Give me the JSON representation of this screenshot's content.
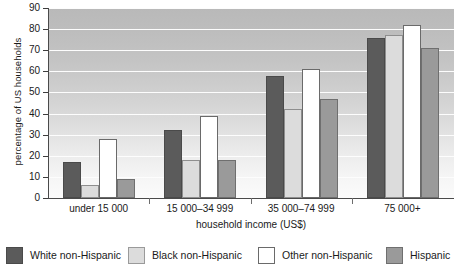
{
  "chart_data": {
    "type": "bar",
    "title": "",
    "xlabel": "household income (US$)",
    "ylabel": "percentage of US households",
    "categories": [
      "under 15 000",
      "15 000–34 999",
      "35 000–74 999",
      "75 000+"
    ],
    "series": [
      {
        "name": "White non-Hispanic",
        "color": "#5b5b5b",
        "values": [
          17,
          32,
          58,
          76
        ]
      },
      {
        "name": "Black non-Hispanic",
        "color": "#dcdcdc",
        "values": [
          6,
          18,
          42,
          77
        ]
      },
      {
        "name": "Other non-Hispanic",
        "color": "#ffffff",
        "values": [
          28,
          39,
          61,
          82
        ]
      },
      {
        "name": "Hispanic",
        "color": "#9a9a9a",
        "values": [
          9,
          18,
          47,
          71
        ]
      }
    ],
    "ylim": [
      0,
      90
    ],
    "ytick_values": [
      0,
      10,
      20,
      30,
      40,
      50,
      60,
      70,
      80,
      90
    ],
    "ytick_labels": [
      "0",
      "10",
      "20",
      "30",
      "40",
      "50",
      "60",
      "70",
      "80",
      "90"
    ],
    "grid": true,
    "legend_position": "bottom"
  }
}
